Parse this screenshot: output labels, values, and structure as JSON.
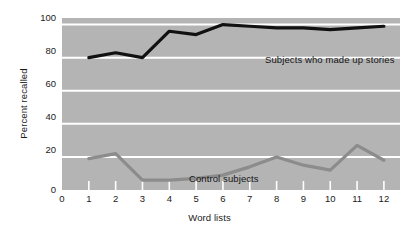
{
  "chart_data": {
    "type": "line",
    "title": "",
    "xlabel": "Word lists",
    "ylabel": "Percent recalled",
    "x": [
      1,
      2,
      3,
      4,
      5,
      6,
      7,
      8,
      9,
      10,
      11,
      12
    ],
    "xlim": [
      0,
      12.6
    ],
    "ylim": [
      0,
      104
    ],
    "xticks": [
      "0",
      "1",
      "2",
      "3",
      "4",
      "5",
      "6",
      "7",
      "8",
      "9",
      "10",
      "11",
      "12"
    ],
    "yticks": [
      "0",
      "20",
      "40",
      "60",
      "80",
      "100"
    ],
    "grid": "horizontal-white-gridlines-on-gray-panel",
    "legend_position": "inline-annotation",
    "panel_color": "#b4b4b4",
    "gridline_color": "#ffffff",
    "series": [
      {
        "name": "Subjects who made up stories",
        "color": "#111111",
        "values": [
          80,
          83,
          80,
          96,
          94,
          100,
          99,
          98,
          98,
          97,
          98,
          99
        ]
      },
      {
        "name": "Control subjects",
        "color": "#8c8c8c",
        "values": [
          19,
          22,
          6,
          6,
          7,
          9,
          14,
          20,
          15,
          12,
          27,
          18
        ]
      }
    ]
  },
  "axes": {
    "y_title": "Percent recalled",
    "x_title": "Word lists",
    "y_tick_labels": [
      "100",
      "80",
      "60",
      "40",
      "20",
      "0"
    ],
    "x_tick_labels": [
      "0",
      "1",
      "2",
      "3",
      "4",
      "5",
      "6",
      "7",
      "8",
      "9",
      "10",
      "11",
      "12"
    ]
  },
  "annotations": {
    "story_label": "Subjects who made up stories",
    "control_label": "Control subjects"
  }
}
